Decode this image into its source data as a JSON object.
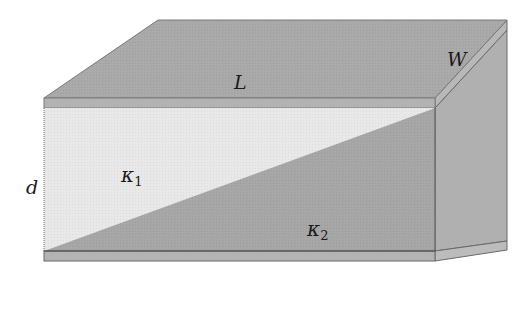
{
  "diagram": {
    "labels": {
      "length": "L",
      "width": "W",
      "separation": "d",
      "kappa1_symbol": "κ",
      "kappa1_sub": "1",
      "kappa2_symbol": "κ",
      "kappa2_sub": "2"
    },
    "colors": {
      "top_face": "#a9a9a9",
      "plate_edge": "#b3b3b3",
      "dielectric_1": "#e8e8e8",
      "dielectric_2": "#a6a6a6",
      "side_face": "#b0b0b0",
      "outline": "#555555"
    }
  }
}
